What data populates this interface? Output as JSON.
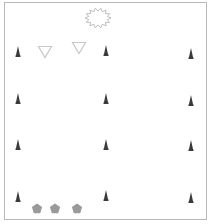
{
  "board": {
    "border_color": "#b8b8b8",
    "background": "#ffffff"
  },
  "colors": {
    "spike": "#3a3a3a",
    "triangle_stroke": "#c8c8c8",
    "starburst_stroke": "#b0b0b0",
    "pentagon_fill": "#9a9a9a"
  },
  "starburst": {
    "x": 98,
    "y": 18,
    "label": "starburst"
  },
  "triangles": [
    {
      "x": 45,
      "y": 52
    },
    {
      "x": 79,
      "y": 48
    }
  ],
  "spikes": [
    {
      "x": 18,
      "y": 51
    },
    {
      "x": 106,
      "y": 50
    },
    {
      "x": 191,
      "y": 53
    },
    {
      "x": 18,
      "y": 98
    },
    {
      "x": 106,
      "y": 98
    },
    {
      "x": 191,
      "y": 100
    },
    {
      "x": 18,
      "y": 144
    },
    {
      "x": 106,
      "y": 144
    },
    {
      "x": 191,
      "y": 145
    },
    {
      "x": 18,
      "y": 196
    },
    {
      "x": 106,
      "y": 195
    },
    {
      "x": 191,
      "y": 197
    }
  ],
  "pentagons": [
    {
      "x": 37,
      "y": 208
    },
    {
      "x": 55,
      "y": 208
    },
    {
      "x": 77,
      "y": 208
    }
  ]
}
